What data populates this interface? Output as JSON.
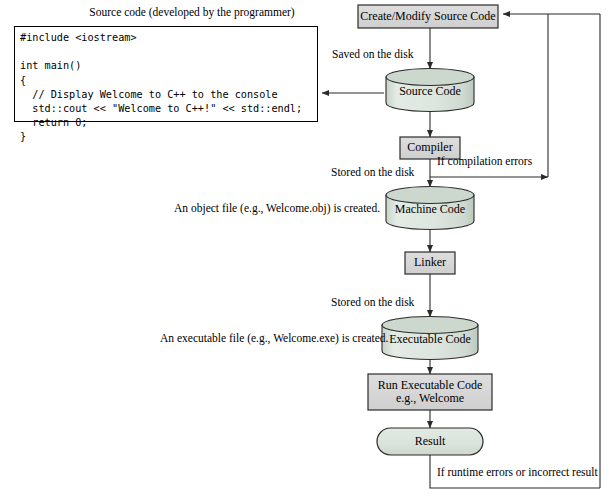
{
  "diagram": {
    "colors": {
      "rect_fill": "#d6d6d6",
      "cylinder_fill": "#dbe4dc",
      "cylinder_top_fill": "#c3cfc4",
      "stadium_fill": "#dbe4dc",
      "stroke": "#2b2b2b",
      "text": "#000000",
      "page_background": "#ffffff"
    },
    "source_panel": {
      "caption": "Source code (developed by the programmer)",
      "code": "#include <iostream>\n\nint main()\n{\n  // Display Welcome to C++ to the console\n  std::cout << \"Welcome to C++!\" << std::endl;\n  return 0;\n}"
    },
    "nodes": [
      {
        "id": "create_modify",
        "shape": "rect",
        "label": "Create/Modify Source Code"
      },
      {
        "id": "source_code",
        "shape": "cylinder",
        "label": "Source Code"
      },
      {
        "id": "compiler",
        "shape": "rect",
        "label": "Compiler"
      },
      {
        "id": "machine_code",
        "shape": "cylinder",
        "label": "Machine Code"
      },
      {
        "id": "linker",
        "shape": "rect",
        "label": "Linker"
      },
      {
        "id": "exec_code",
        "shape": "cylinder",
        "label": "Executable Code"
      },
      {
        "id": "run_exec",
        "shape": "rect",
        "label_line1": "Run Executable Code",
        "label_line2": "e.g., Welcome"
      },
      {
        "id": "result",
        "shape": "stadium",
        "label": "Result"
      }
    ],
    "edge_labels": {
      "saved_on_disk": "Saved on the disk",
      "stored_on_disk_1": "Stored on the disk",
      "stored_on_disk_2": "Stored on the disk",
      "compilation_errors": "If compilation errors",
      "runtime_errors": "If runtime errors or incorrect result"
    },
    "annotations": {
      "object_file": "An object file (e.g., Welcome.obj) is created.",
      "executable_file": "An executable file (e.g., Welcome.exe) is created."
    }
  }
}
